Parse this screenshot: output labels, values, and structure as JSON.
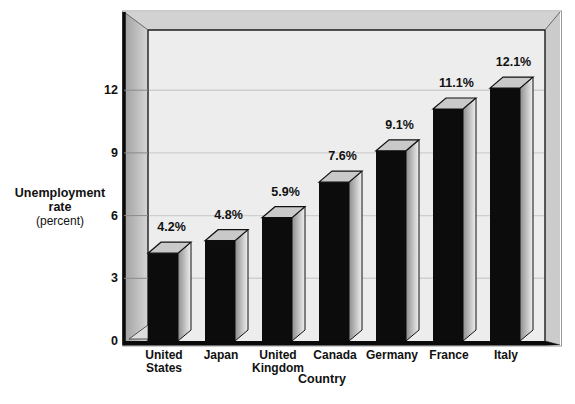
{
  "page": {
    "background": "#ffffff"
  },
  "chart_data": {
    "type": "bar",
    "categories": [
      "United\nStates",
      "Japan",
      "United\nKingdom",
      "Canada",
      "Germany",
      "France",
      "Italy"
    ],
    "values": [
      4.2,
      4.8,
      5.9,
      7.6,
      9.1,
      11.1,
      12.1
    ],
    "value_labels": [
      "4.2%",
      "4.8%",
      "5.9%",
      "7.6%",
      "9.1%",
      "11.1%",
      "12.1%"
    ],
    "xlabel": "Country",
    "ylabel_lines": [
      "Unemployment",
      "rate",
      "(percent)"
    ],
    "yticks": [
      0,
      3,
      6,
      9,
      12
    ],
    "ylim": [
      0,
      14.9
    ],
    "grid": true,
    "legend": "none",
    "style": "3d-extruded-bars",
    "colors": {
      "bar_front": "#0c0c0c",
      "bar_top": "#c9c9c9",
      "bar_side_dark": "#8e8e8e",
      "bar_side_light": "#f0f0f0",
      "back_wall": "#ededed",
      "gridline": "#cfcfcf",
      "frame_top": "#d2d2d2",
      "frame_left_dark": "#a0a0a0",
      "frame_left_light": "#d6d6d6",
      "frame_right": "#cbcbcb",
      "outline": "#1c1c1c",
      "text": "#111111"
    }
  }
}
